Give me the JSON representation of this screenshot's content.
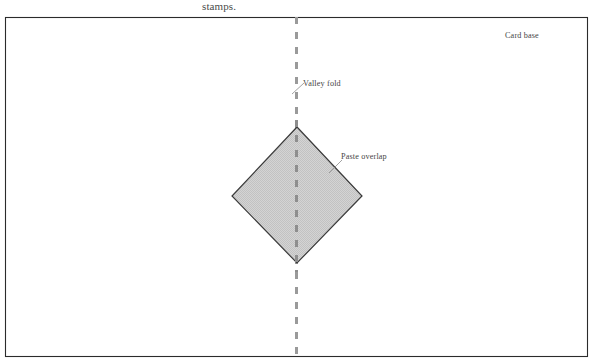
{
  "caption": {
    "text": "stamps."
  },
  "diagram": {
    "colors": {
      "frame_stroke": "#2b2b2b",
      "background": "#ffffff",
      "diamond_fill": "#cfcfcf",
      "diamond_stroke": "#3a3a3a",
      "fold_line": "#9a9a9a",
      "leader_line": "#8a8a8a",
      "label_text": "#454545",
      "caption_text": "#4b4b4b"
    },
    "card_base": {
      "label": "Card base",
      "label_x": 505,
      "label_y": 38,
      "x": 5,
      "y": 17,
      "width": 583,
      "height": 340
    },
    "valley_fold": {
      "label": "Valley fold",
      "label_x": 303,
      "label_y": 86,
      "line_x": 296.5,
      "line_top": 17,
      "line_bottom": 357,
      "dash": "7 8",
      "width": 3,
      "leader": {
        "x1": 292,
        "y1": 94,
        "x2": 304,
        "y2": 83
      }
    },
    "paste_overlap": {
      "label": "Paste overlap",
      "label_x": 341,
      "label_y": 159,
      "leader": {
        "x1": 329,
        "y1": 173,
        "x2": 342,
        "y2": 160
      }
    },
    "diamond": {
      "name": "pasted-diamond",
      "top": {
        "x": 297,
        "y": 127
      },
      "right": {
        "x": 362,
        "y": 196
      },
      "bottom": {
        "x": 297,
        "y": 263
      },
      "left": {
        "x": 232,
        "y": 196
      }
    }
  }
}
